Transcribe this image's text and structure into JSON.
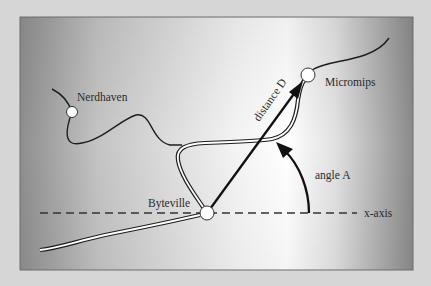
{
  "diagram": {
    "type": "map-vector-diagram",
    "colors": {
      "page_background": "#d6d6d6",
      "panel_edge": "#8c8c8c",
      "panel_center": "#ffffff",
      "ink": "#1e1e1e",
      "town_fill": "#ffffff"
    },
    "towns": [
      {
        "id": "nerdhaven",
        "label": "Nerdhaven",
        "x": 72,
        "y": 112
      },
      {
        "id": "byteville",
        "label": "Byteville",
        "x": 207,
        "y": 213
      },
      {
        "id": "micromips",
        "label": "Micromips",
        "x": 307,
        "y": 75
      }
    ],
    "labels": {
      "nerdhaven": "Nerdhaven",
      "byteville": "Byteville",
      "micromips": "Micromips",
      "distance": "distance D",
      "angle": "angle A",
      "x_axis": "x-axis"
    },
    "vector": {
      "from": "byteville",
      "to": "micromips",
      "label": "distance D"
    },
    "angle": {
      "label": "angle A",
      "reference": "x-axis"
    }
  }
}
